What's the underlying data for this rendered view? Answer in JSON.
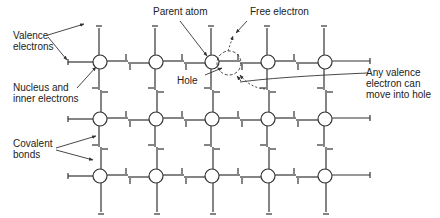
{
  "diagram": {
    "type": "semiconductor-crystal-lattice",
    "grid": {
      "columns_x": [
        100,
        156,
        212,
        268,
        325
      ],
      "rows_y": [
        62,
        119,
        176
      ],
      "atom_radius": 7
    },
    "labels": {
      "valence_electrons": "Valence\nelectrons",
      "nucleus": "Nucleus and\ninner electrons",
      "covalent_bonds": "Covalent\nbonds",
      "parent_atom": "Parent atom",
      "free_electron": "Free electron",
      "hole": "Hole",
      "any_valence": "Any valence\nelectron can\nmove into hole"
    },
    "colors": {
      "line": "#333333",
      "text": "#222222",
      "background": "#ffffff"
    }
  }
}
